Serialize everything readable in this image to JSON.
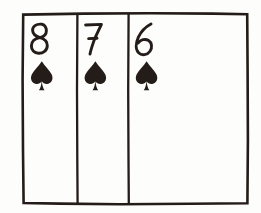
{
  "scene": {
    "title": "Three fanned playing cards",
    "description": "Hand-drawn ink sketch of three overlapping playing cards showing the eight, seven and six of spades",
    "width": 261,
    "height": 213,
    "background_color": "#fdfdfc",
    "ink_color": "#241c18"
  },
  "frame": {
    "name": "card-fan-outline",
    "left": 22,
    "top": 13,
    "right": 248,
    "bottom": 204
  },
  "dividers": [
    {
      "name": "divider-between-card-1-and-2",
      "x": 77
    },
    {
      "name": "divider-between-card-2-and-3",
      "x": 128
    }
  ],
  "suit": {
    "name": "spades",
    "symbol": "♠",
    "color": "#241c18"
  },
  "cards": [
    {
      "index": 1,
      "rank": "8",
      "suit_symbol": "♠",
      "suit_name": "spades",
      "label": "8 of spades",
      "left": 22,
      "width": 55,
      "rank_x": 30,
      "rank_y": 22,
      "pip_x": 31,
      "pip_y": 60
    },
    {
      "index": 2,
      "rank": "7",
      "suit_symbol": "♠",
      "suit_name": "spades",
      "label": "7 of spades",
      "left": 77,
      "width": 51,
      "rank_x": 84,
      "rank_y": 22,
      "pip_x": 85,
      "pip_y": 60
    },
    {
      "index": 3,
      "rank": "6",
      "suit_symbol": "♠",
      "suit_name": "spades",
      "label": "6 of spades",
      "left": 128,
      "width": 120,
      "rank_x": 135,
      "rank_y": 22,
      "pip_x": 136,
      "pip_y": 60
    }
  ]
}
